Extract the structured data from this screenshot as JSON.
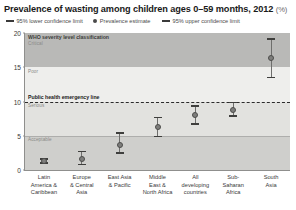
{
  "chart": {
    "title": "Prevalence of wasting among children ages 0–59 months, 2012",
    "title_unit": "(%)",
    "legend": [
      {
        "label": "95% lower confidence limit",
        "marker": "dash-icon"
      },
      {
        "label": "Prevalence estimate",
        "marker": "dot-icon"
      },
      {
        "label": "95% upper confidence limit",
        "marker": "dash-icon"
      }
    ],
    "bands": {
      "who_header": "WHO severity level classification",
      "critical": "Critical",
      "poor": "Poor",
      "serious": "Serious",
      "acceptable": "Acceptable",
      "emergency_line": "Public health emergency line"
    }
  },
  "chart_data": {
    "type": "scatter",
    "title": "Prevalence of wasting among children ages 0–59 months, 2012 (%)",
    "xlabel": "",
    "ylabel": "",
    "ylim": [
      0,
      20
    ],
    "yticks": [
      0,
      5,
      10,
      15,
      20
    ],
    "grid": false,
    "legend_position": "top",
    "categories": [
      "Latin\nAmerica &\nCaribbean",
      "Europe\n& Central\nAsia",
      "East Asia\n& Pacific",
      "Middle\nEast &\nNorth Africa",
      "All\ndeveloping\ncountries",
      "Sub-\nSaharan\nAfrica",
      "South\nAsia"
    ],
    "series": [
      {
        "name": "Prevalence estimate",
        "values": [
          1.3,
          1.6,
          3.7,
          6.3,
          8.0,
          8.7,
          16.3
        ]
      },
      {
        "name": "95% lower confidence limit",
        "values": [
          0.9,
          0.7,
          2.4,
          4.8,
          6.6,
          7.8,
          13.4
        ]
      },
      {
        "name": "95% upper confidence limit",
        "values": [
          1.7,
          2.8,
          5.5,
          7.8,
          9.5,
          10.0,
          19.2
        ]
      }
    ],
    "annotations": [
      {
        "text": "Public health emergency line",
        "y": 10,
        "style": "dashed"
      },
      {
        "text": "WHO severity level classification",
        "y": 20
      },
      {
        "text": "Critical",
        "y_range": [
          15,
          20
        ]
      },
      {
        "text": "Poor",
        "y_range": [
          10,
          15
        ]
      },
      {
        "text": "Serious",
        "y_range": [
          5,
          10
        ]
      },
      {
        "text": "Acceptable",
        "y_range": [
          0,
          5
        ]
      }
    ]
  }
}
